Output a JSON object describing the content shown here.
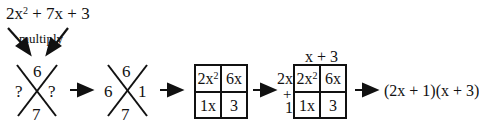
{
  "expression": {
    "lead": "2x",
    "lead_exp": "2",
    "rest": " + 7x + 3",
    "annotation": "multiply"
  },
  "x_puzzle_1": {
    "top": "6",
    "left": "?",
    "right": "?",
    "bottom": "7"
  },
  "x_puzzle_2": {
    "top": "6",
    "left": "6",
    "right": "1",
    "bottom": "7"
  },
  "box_1": {
    "cells": [
      {
        "base": "2x",
        "exp": "2"
      },
      {
        "base": "6x",
        "exp": ""
      },
      {
        "base": "1x",
        "exp": ""
      },
      {
        "base": "3",
        "exp": ""
      }
    ]
  },
  "box_2": {
    "top_label": "x + 3",
    "side_top": "2x",
    "side_plus": "+",
    "side_bottom": "1",
    "cells": [
      {
        "base": "2x",
        "exp": "2"
      },
      {
        "base": "6x",
        "exp": ""
      },
      {
        "base": "1x",
        "exp": ""
      },
      {
        "base": "3",
        "exp": ""
      }
    ]
  },
  "result": "(2x + 1)(x + 3)"
}
